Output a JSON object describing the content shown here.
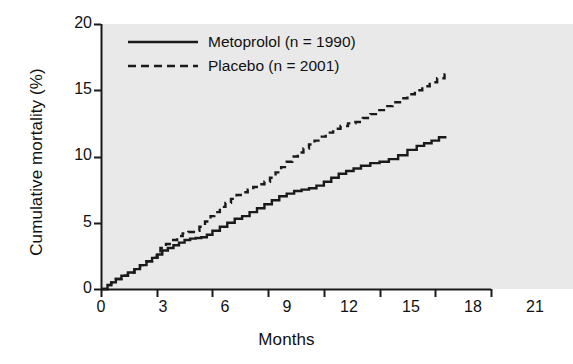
{
  "chart_data": {
    "type": "line",
    "title": "",
    "xlabel": "Months",
    "ylabel": "Cumulative mortality (%)",
    "xlim": [
      0,
      21
    ],
    "ylim": [
      0,
      20
    ],
    "xticks": [
      0,
      3,
      6,
      9,
      12,
      15,
      18,
      21
    ],
    "yticks": [
      0,
      5,
      10,
      15,
      20
    ],
    "grid": false,
    "step_plot": true,
    "legend_position": "top-left-inside",
    "plot_background": "#e9e9e9",
    "line_color": "#111111",
    "series": [
      {
        "name": "Metoprolol (n = 1990)",
        "style": "solid",
        "x": [
          0.0,
          0.35,
          0.55,
          0.8,
          1.1,
          1.45,
          1.8,
          2.1,
          2.45,
          2.75,
          3.05,
          3.3,
          3.6,
          3.9,
          4.2,
          4.5,
          4.8,
          5.1,
          5.4,
          5.7,
          6.0,
          6.4,
          6.8,
          7.2,
          7.6,
          8.0,
          8.4,
          8.8,
          9.2,
          9.6,
          10.0,
          10.4,
          10.8,
          11.2,
          11.6,
          12.0,
          12.4,
          12.8,
          13.2,
          13.6,
          14.0,
          14.5,
          15.0,
          15.5,
          16.0,
          16.5,
          17.0,
          17.4,
          17.8,
          18.2,
          18.6
        ],
        "y": [
          0.0,
          0.3,
          0.5,
          0.75,
          1.0,
          1.25,
          1.5,
          1.8,
          2.1,
          2.35,
          2.6,
          2.9,
          3.1,
          3.3,
          3.5,
          3.7,
          3.8,
          3.85,
          3.9,
          4.1,
          4.4,
          4.7,
          5.0,
          5.3,
          5.5,
          5.8,
          6.1,
          6.4,
          6.7,
          7.0,
          7.2,
          7.4,
          7.5,
          7.6,
          7.8,
          8.1,
          8.4,
          8.7,
          8.9,
          9.1,
          9.3,
          9.5,
          9.6,
          9.8,
          10.1,
          10.5,
          10.8,
          11.0,
          11.2,
          11.45,
          11.45
        ]
      },
      {
        "name": "Placebo (n = 2001)",
        "style": "dashed",
        "x": [
          0.0,
          0.35,
          0.55,
          0.8,
          1.1,
          1.45,
          1.8,
          2.1,
          2.45,
          2.75,
          3.0,
          3.2,
          3.5,
          3.8,
          4.1,
          4.4,
          4.7,
          5.0,
          5.3,
          5.6,
          5.9,
          6.1,
          6.4,
          6.7,
          7.0,
          7.3,
          7.6,
          7.9,
          8.2,
          8.5,
          8.8,
          9.1,
          9.4,
          9.7,
          10.0,
          10.3,
          10.6,
          10.9,
          11.2,
          11.5,
          11.8,
          12.1,
          12.5,
          12.9,
          13.3,
          13.7,
          14.1,
          14.5,
          14.9,
          15.3,
          15.7,
          16.1,
          16.5,
          16.9,
          17.3,
          17.7,
          18.1,
          18.5,
          18.7
        ],
        "y": [
          0.0,
          0.3,
          0.5,
          0.75,
          1.0,
          1.25,
          1.5,
          1.8,
          2.1,
          2.35,
          2.7,
          3.1,
          3.4,
          3.7,
          4.0,
          4.2,
          4.3,
          4.4,
          4.7,
          5.1,
          5.5,
          5.8,
          6.2,
          6.5,
          6.8,
          7.1,
          7.3,
          7.5,
          7.7,
          7.9,
          8.1,
          8.4,
          8.8,
          9.2,
          9.6,
          10.0,
          10.3,
          10.6,
          10.9,
          11.2,
          11.5,
          11.8,
          12.1,
          12.3,
          12.5,
          12.6,
          12.9,
          13.2,
          13.5,
          13.8,
          14.1,
          14.4,
          14.7,
          15.0,
          15.3,
          15.6,
          15.9,
          16.2,
          16.2
        ]
      }
    ]
  },
  "axes": {
    "y_title": "Cumulative mortality (%)",
    "x_title": "Months",
    "y_tick_labels": [
      "20",
      "15",
      "10",
      "5",
      "0"
    ],
    "x_tick_labels": [
      "0",
      "3",
      "6",
      "9",
      "12",
      "15",
      "18",
      "21"
    ]
  },
  "legend": {
    "entries": [
      {
        "label": "Metoprolol (n = 1990)",
        "style": "solid"
      },
      {
        "label": "Placebo (n = 2001)",
        "style": "dashed"
      }
    ]
  }
}
